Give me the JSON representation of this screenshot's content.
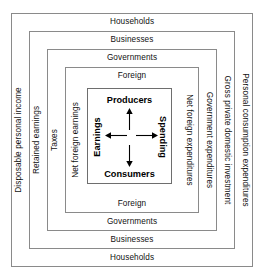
{
  "diagram": {
    "type": "nested-boxes",
    "colors": {
      "background": "#ffffff",
      "border": "#8a8a8a",
      "core_border": "#6e6e6e",
      "text": "#111111",
      "arrow": "#000000"
    },
    "rings": [
      {
        "id": "households",
        "top_label": "Households",
        "bottom_label": "Households",
        "left_label": "Disposable personal income",
        "right_label": "Personal consumption expenditures"
      },
      {
        "id": "businesses",
        "top_label": "Businesses",
        "bottom_label": "Businesses",
        "left_label": "Retained earnings",
        "right_label": "Gross private domestic investment"
      },
      {
        "id": "governments",
        "top_label": "Governments",
        "bottom_label": "Governments",
        "left_label": "Taxes",
        "right_label": "Government expenditures"
      },
      {
        "id": "foreign",
        "top_label": "Foreign",
        "bottom_label": "Foreign",
        "left_label": "Net foreign earnings",
        "right_label": "Net foreign expenditures"
      }
    ],
    "core": {
      "top_node": "Producers",
      "bottom_node": "Consumers",
      "left_label": "Earnings",
      "right_label": "Spending",
      "arrows": [
        {
          "name": "arrow-up",
          "direction": "up"
        },
        {
          "name": "arrow-down",
          "direction": "down"
        },
        {
          "name": "arrow-left",
          "direction": "left"
        },
        {
          "name": "arrow-right",
          "direction": "right"
        }
      ]
    }
  }
}
